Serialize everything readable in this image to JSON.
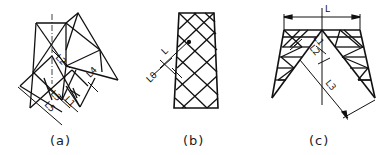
{
  "figures": [
    {
      "id": "a",
      "caption": "(a)",
      "description": "Cross-braced lattice with offset triangular panel; member lengths labeled",
      "labels": [
        "L2",
        "L3",
        "L1",
        "L4",
        "L5"
      ]
    },
    {
      "id": "b",
      "caption": "(b)",
      "description": "Tapered tower face with diamond (K/X) lattice bracing",
      "labels": [
        "L",
        "L0"
      ]
    },
    {
      "id": "c",
      "caption": "(c)",
      "description": "Inverted-V portal frame with triangulated lattice legs",
      "labels": [
        "L",
        "L1",
        "L2",
        "L3"
      ]
    }
  ],
  "colors": {
    "line": "#111111",
    "background": "#ffffff"
  }
}
